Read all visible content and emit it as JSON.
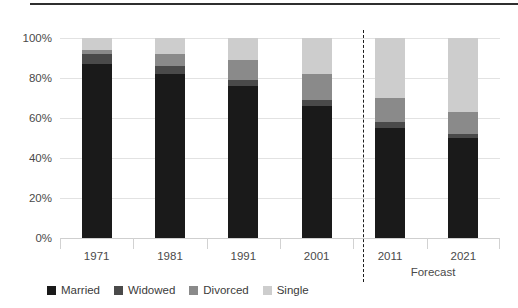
{
  "chart_data": {
    "type": "bar",
    "subtype": "stacked-bar-100-percent",
    "title": "",
    "xlabel": "",
    "ylabel": "",
    "ylim": [
      0,
      100
    ],
    "ytick_labels": [
      "0%",
      "20%",
      "40%",
      "60%",
      "80%",
      "100%"
    ],
    "ytick_values": [
      0,
      20,
      40,
      60,
      80,
      100
    ],
    "grid": true,
    "legend_position": "bottom-left",
    "categories": [
      "1971",
      "1981",
      "1991",
      "2001",
      "2011",
      "2021"
    ],
    "series": [
      {
        "name": "Married",
        "color": "#1a1a1a",
        "values": [
          87,
          82,
          76,
          66,
          55,
          50
        ]
      },
      {
        "name": "Widowed",
        "color": "#4a4a4a",
        "values": [
          5,
          4,
          3,
          3,
          3,
          2
        ]
      },
      {
        "name": "Divorced",
        "color": "#8a8a8a",
        "values": [
          2,
          6,
          10,
          13,
          12,
          11
        ]
      },
      {
        "name": "Single",
        "color": "#cdcdcd",
        "values": [
          6,
          8,
          11,
          18,
          30,
          37
        ]
      }
    ],
    "annotations": [
      {
        "name": "forecast-divider",
        "text": "Forecast",
        "after_category": "2001"
      }
    ]
  },
  "axis": {
    "y_labels": [
      "100%",
      "80%",
      "60%",
      "40%",
      "20%",
      "0%"
    ],
    "x_labels": [
      "1971",
      "1981",
      "1991",
      "2001",
      "2011",
      "2021"
    ]
  },
  "forecast": {
    "label": "Forecast"
  },
  "legend": {
    "items": [
      {
        "label": "Married",
        "color": "#1a1a1a"
      },
      {
        "label": "Widowed",
        "color": "#4a4a4a"
      },
      {
        "label": "Divorced",
        "color": "#8a8a8a"
      },
      {
        "label": "Single",
        "color": "#cdcdcd"
      }
    ]
  }
}
